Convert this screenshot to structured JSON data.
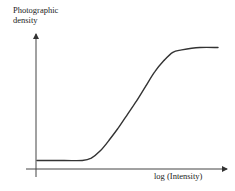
{
  "chart_data": {
    "type": "line",
    "title": "",
    "xlabel": "log (Intensity)",
    "ylabel": "Photographic density",
    "ylabel_lines": [
      "Photographic",
      "density"
    ],
    "grid": false,
    "legend": null,
    "ticks": "none",
    "series": [
      {
        "name": "characteristic curve",
        "description": "S-shaped (sigmoid) curve: low flat fog level, roughly linear rise, then saturation plateau",
        "x": [
          0.0,
          0.15,
          0.25,
          0.3,
          0.35,
          0.4,
          0.45,
          0.5,
          0.55,
          0.6,
          0.65,
          0.7,
          0.75,
          0.8,
          0.9,
          1.0
        ],
        "y": [
          0.07,
          0.07,
          0.07,
          0.09,
          0.15,
          0.24,
          0.34,
          0.45,
          0.56,
          0.68,
          0.8,
          0.89,
          0.96,
          0.98,
          1.0,
          1.0
        ]
      }
    ],
    "xlim": [
      0,
      1
    ],
    "ylim": [
      0,
      1.15
    ]
  }
}
